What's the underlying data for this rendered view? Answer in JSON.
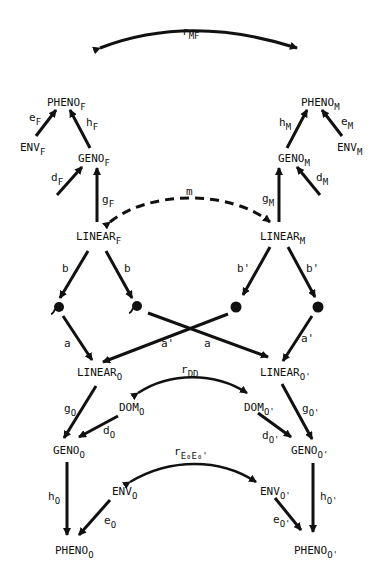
{
  "nodes": {
    "pheno_f": {
      "base": "PHENO",
      "sub": "F"
    },
    "env_f": {
      "base": "ENV",
      "sub": "F"
    },
    "geno_f": {
      "base": "GENO",
      "sub": "F"
    },
    "linear_f": {
      "base": "LINEAR",
      "sub": "F"
    },
    "pheno_m": {
      "base": "PHENO",
      "sub": "M"
    },
    "env_m": {
      "base": "ENV",
      "sub": "M"
    },
    "geno_m": {
      "base": "GENO",
      "sub": "M"
    },
    "linear_m": {
      "base": "LINEAR",
      "sub": "M"
    },
    "linear_o": {
      "base": "LINEAR",
      "sub": "O"
    },
    "linear_o2": {
      "base": "LINEAR",
      "sub": "O'"
    },
    "dom_o": {
      "base": "DOM",
      "sub": "O"
    },
    "dom_o2": {
      "base": "DOM",
      "sub": "O'"
    },
    "geno_o": {
      "base": "GENO",
      "sub": "O"
    },
    "geno_o2": {
      "base": "GENO",
      "sub": "O'"
    },
    "env_o": {
      "base": "ENV",
      "sub": "O"
    },
    "env_o2": {
      "base": "ENV",
      "sub": "O'"
    },
    "pheno_o": {
      "base": "PHENO",
      "sub": "O"
    },
    "pheno_o2": {
      "base": "PHENO",
      "sub": "O'"
    }
  },
  "paths": {
    "r_mf": {
      "base": "r",
      "sub": "MF"
    },
    "e_f": {
      "base": "e",
      "sub": "F"
    },
    "h_f": {
      "base": "h",
      "sub": "F"
    },
    "d_f": {
      "base": "d",
      "sub": "F"
    },
    "g_f": {
      "base": "g",
      "sub": "F"
    },
    "e_m": {
      "base": "e",
      "sub": "M"
    },
    "h_m": {
      "base": "h",
      "sub": "M"
    },
    "d_m": {
      "base": "d",
      "sub": "M"
    },
    "g_m": {
      "base": "g",
      "sub": "M"
    },
    "m": {
      "base": "m",
      "sub": ""
    },
    "b1": {
      "base": "b",
      "sub": ""
    },
    "b2": {
      "base": "b",
      "sub": ""
    },
    "b3": {
      "base": "b'",
      "sub": ""
    },
    "b4": {
      "base": "b'",
      "sub": ""
    },
    "a1": {
      "base": "a",
      "sub": ""
    },
    "a2": {
      "base": "a'",
      "sub": ""
    },
    "a3": {
      "base": "a",
      "sub": ""
    },
    "a4": {
      "base": "a'",
      "sub": ""
    },
    "r_dd": {
      "base": "r",
      "sub": "DD"
    },
    "g_o": {
      "base": "g",
      "sub": "O"
    },
    "d_o": {
      "base": "d",
      "sub": "O"
    },
    "g_o2": {
      "base": "g",
      "sub": "O'"
    },
    "d_o2": {
      "base": "d",
      "sub": "O'"
    },
    "r_ee": {
      "base": "r",
      "sub": "E₀E₀'"
    },
    "h_o": {
      "base": "h",
      "sub": "O"
    },
    "e_o": {
      "base": "e",
      "sub": "O"
    },
    "h_o2": {
      "base": "h",
      "sub": "O'"
    },
    "e_o2": {
      "base": "e",
      "sub": "O'"
    }
  }
}
